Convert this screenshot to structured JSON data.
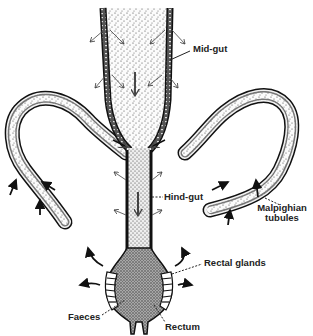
{
  "diagram": {
    "labels": {
      "mid_gut": "Mid-gut",
      "hind_gut": "Hind-gut",
      "malpighian_line1": "Malpighian",
      "malpighian_line2": "tubules",
      "rectal_glands": "Rectal glands",
      "faeces": "Faeces",
      "rectum": "Rectum"
    },
    "colors": {
      "ink": "#222222",
      "stipple": "#444444",
      "background": "#ffffff",
      "rectum_fill": "#8c8c8c"
    },
    "arrows": {
      "mid_gut": "thin arrows showing absorption outward from mid-gut lumen",
      "malpighian": "bold arrows pointing into tubules (uptake from haemolymph)",
      "rectal": "bold arrows pointing outward from rectal glands (reabsorption)",
      "lumen": "downward arrows showing flow along gut"
    }
  }
}
